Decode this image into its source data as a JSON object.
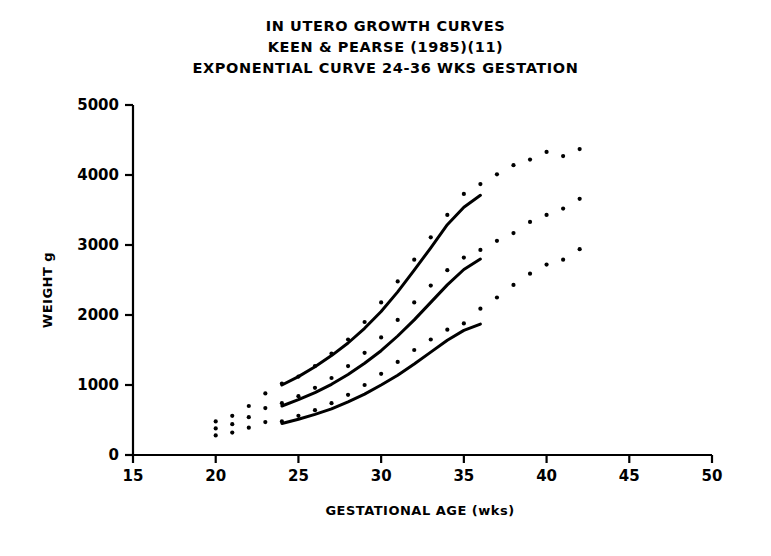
{
  "chart_data": {
    "type": "scatter",
    "title": "IN UTERO GROWTH CURVES",
    "title_lines": [
      "IN UTERO GROWTH CURVES",
      "KEEN & PEARSE (1985)(11)",
      "EXPONENTIAL CURVE 24-36 WKS GESTATION"
    ],
    "xlabel": "GESTATIONAL AGE (wks)",
    "ylabel": "WEIGHT g",
    "xlim": [
      15,
      50
    ],
    "ylim": [
      0,
      5000
    ],
    "xticks": [
      15,
      20,
      25,
      30,
      35,
      40,
      45,
      50
    ],
    "yticks": [
      0,
      1000,
      2000,
      3000,
      4000,
      5000
    ],
    "xtick_labels": [
      "15",
      "20",
      "25",
      "30",
      "35",
      "40",
      "45",
      "50"
    ],
    "ytick_labels": [
      "0",
      "1000",
      "2000",
      "3000",
      "4000",
      "5000"
    ],
    "grid": false,
    "legend": "none",
    "series": [
      {
        "name": "90th centile points",
        "kind": "scatter",
        "marker": "dot",
        "x": [
          20,
          21,
          22,
          23,
          24,
          25,
          26,
          27,
          28,
          29,
          30,
          31,
          32,
          33,
          34,
          35,
          36,
          37,
          38,
          39,
          40,
          41,
          42
        ],
        "y": [
          480,
          560,
          700,
          880,
          1020,
          1120,
          1270,
          1450,
          1650,
          1900,
          2180,
          2480,
          2790,
          3110,
          3430,
          3730,
          3870,
          4010,
          4140,
          4220,
          4330,
          4270,
          4370
        ]
      },
      {
        "name": "50th centile points",
        "kind": "scatter",
        "marker": "dot",
        "x": [
          20,
          21,
          22,
          23,
          24,
          25,
          26,
          27,
          28,
          29,
          30,
          31,
          32,
          33,
          34,
          35,
          36,
          37,
          38,
          39,
          40,
          41,
          42
        ],
        "y": [
          380,
          440,
          540,
          670,
          740,
          840,
          960,
          1100,
          1270,
          1460,
          1680,
          1930,
          2180,
          2420,
          2640,
          2820,
          2930,
          3060,
          3170,
          3330,
          3430,
          3520,
          3660
        ]
      },
      {
        "name": "10th centile points",
        "kind": "scatter",
        "marker": "dot",
        "x": [
          20,
          21,
          22,
          23,
          24,
          25,
          26,
          27,
          28,
          29,
          30,
          31,
          32,
          33,
          34,
          35,
          36,
          37,
          38,
          39,
          40,
          41,
          42
        ],
        "y": [
          280,
          320,
          390,
          470,
          480,
          560,
          640,
          740,
          860,
          1000,
          1160,
          1330,
          1500,
          1650,
          1790,
          1880,
          2090,
          2250,
          2430,
          2590,
          2720,
          2790,
          2940
        ]
      },
      {
        "name": "exponential fit upper",
        "kind": "line",
        "x_range": [
          24,
          36
        ],
        "x": [
          24,
          25,
          26,
          27,
          28,
          29,
          30,
          31,
          32,
          33,
          34,
          35,
          36
        ],
        "y": [
          1000,
          1120,
          1260,
          1420,
          1600,
          1810,
          2050,
          2330,
          2640,
          2960,
          3290,
          3540,
          3710
        ]
      },
      {
        "name": "exponential fit middle",
        "kind": "line",
        "x_range": [
          24,
          36
        ],
        "x": [
          24,
          25,
          26,
          27,
          28,
          29,
          30,
          31,
          32,
          33,
          34,
          35,
          36
        ],
        "y": [
          700,
          790,
          890,
          1010,
          1150,
          1310,
          1490,
          1700,
          1930,
          2180,
          2430,
          2650,
          2800
        ]
      },
      {
        "name": "exponential fit lower",
        "kind": "line",
        "x_range": [
          24,
          36
        ],
        "x": [
          24,
          25,
          26,
          27,
          28,
          29,
          30,
          31,
          32,
          33,
          34,
          35,
          36
        ],
        "y": [
          450,
          510,
          580,
          660,
          760,
          870,
          1000,
          1140,
          1300,
          1470,
          1640,
          1780,
          1870
        ]
      }
    ],
    "style": {
      "line_color": "#000000",
      "marker_color": "#000000",
      "axis_color": "#000000",
      "background": "#ffffff"
    }
  }
}
